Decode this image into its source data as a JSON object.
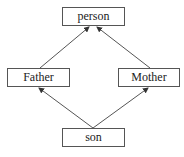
{
  "diagram": {
    "type": "inheritance-graph",
    "nodes": [
      {
        "id": "person",
        "label": "person"
      },
      {
        "id": "father",
        "label": "Father"
      },
      {
        "id": "mother",
        "label": "Mother"
      },
      {
        "id": "son",
        "label": "son"
      }
    ],
    "edges": [
      {
        "from": "Father",
        "to": "person"
      },
      {
        "from": "Mother",
        "to": "person"
      },
      {
        "from": "son",
        "to": "Father"
      },
      {
        "from": "son",
        "to": "Mother"
      }
    ],
    "colors": {
      "stroke": "#555555",
      "text": "#222222",
      "background": "#ffffff"
    }
  }
}
